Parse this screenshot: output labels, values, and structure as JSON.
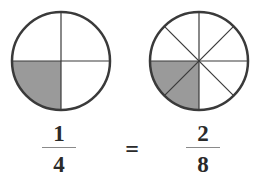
{
  "diagram": {
    "left_circle": {
      "parts": 4,
      "shaded_parts": 1,
      "shaded_region": "bottom-left quarter"
    },
    "right_circle": {
      "parts": 8,
      "shaded_parts": 2,
      "shaded_region": "bottom-left two eighths"
    },
    "colors": {
      "shade": "#9a9a9a",
      "outline": "#3a3a3a",
      "background": "#ffffff"
    }
  },
  "equation": {
    "left": {
      "numerator": "1",
      "denominator": "4"
    },
    "operator": "=",
    "right": {
      "numerator": "2",
      "denominator": "8"
    }
  }
}
